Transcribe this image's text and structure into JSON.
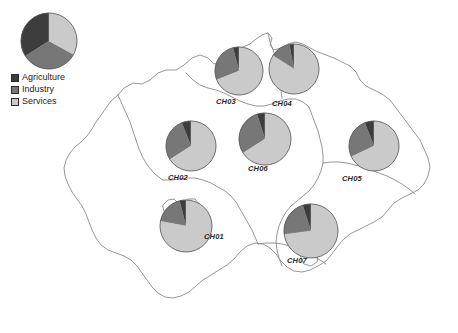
{
  "figure": {
    "map_name": "Switzerland"
  },
  "legend": {
    "title": "",
    "items": [
      {
        "label": "Agriculture",
        "color": "#3d3d3d",
        "swatch_name": "legend-swatch-agriculture"
      },
      {
        "label": "Industry",
        "color": "#777777",
        "swatch_name": "legend-swatch-industry"
      },
      {
        "label": "Services",
        "color": "#cacaca",
        "swatch_name": "legend-swatch-services"
      }
    ],
    "overview_pie": {
      "name": "legend-overview-pie",
      "categories": [
        "Agriculture",
        "Industry",
        "Services"
      ],
      "values": [
        34,
        33,
        33
      ],
      "start_angle": 0
    }
  },
  "colors": {
    "agriculture": "#3d3d3d",
    "industry": "#777777",
    "services": "#cacaca",
    "pie_outline": "#555555",
    "map_outline": "#8a8a8a",
    "background": "#ffffff",
    "text": "#1c1c1c"
  },
  "chart_data": {
    "type": "pie",
    "categories": [
      "Agriculture",
      "Industry",
      "Services"
    ],
    "legend_position": "top-left",
    "grid": false,
    "charts": [
      {
        "id": "CH01",
        "label": "CH01",
        "name": "region-pie-ch01",
        "values": [
          4,
          18,
          78
        ],
        "cx": 186,
        "cy": 226,
        "r": 26,
        "label_x": 204,
        "label_y": 232
      },
      {
        "id": "CH02",
        "label": "CH02",
        "name": "region-pie-ch02",
        "values": [
          6,
          28,
          66
        ],
        "cx": 191,
        "cy": 146,
        "r": 25,
        "label_x": 168,
        "label_y": 173
      },
      {
        "id": "CH03",
        "label": "CH03",
        "name": "region-pie-ch03",
        "values": [
          4,
          27,
          69
        ],
        "cx": 239,
        "cy": 71,
        "r": 24,
        "label_x": 216,
        "label_y": 97
      },
      {
        "id": "CH04",
        "label": "CH04",
        "name": "region-pie-ch04",
        "values": [
          3,
          13,
          84
        ],
        "cx": 294,
        "cy": 69,
        "r": 25,
        "label_x": 272,
        "label_y": 99
      },
      {
        "id": "CH05",
        "label": "CH05",
        "name": "region-pie-ch05",
        "values": [
          6,
          26,
          68
        ],
        "cx": 374,
        "cy": 146,
        "r": 25,
        "label_x": 342,
        "label_y": 174
      },
      {
        "id": "CH06",
        "label": "CH06",
        "name": "region-pie-ch06",
        "values": [
          5,
          29,
          66
        ],
        "cx": 265,
        "cy": 139,
        "r": 26,
        "label_x": 248,
        "label_y": 164
      },
      {
        "id": "CH07",
        "label": "CH07",
        "name": "region-pie-ch07",
        "values": [
          5,
          22,
          73
        ],
        "cx": 311,
        "cy": 231,
        "r": 27,
        "label_x": 287,
        "label_y": 256
      }
    ]
  }
}
